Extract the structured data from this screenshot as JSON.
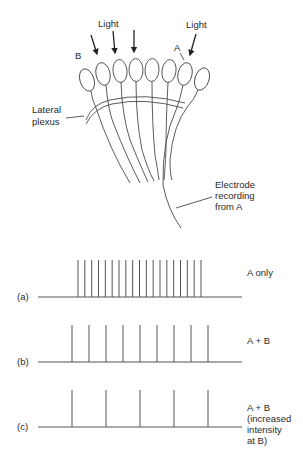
{
  "diagram": {
    "labels": {
      "light_left": "Light",
      "light_right": "Light",
      "cell_b": "B",
      "cell_a": "A",
      "lateral_plexus_1": "Lateral",
      "lateral_plexus_2": "plexus",
      "electrode_1": "Electrode",
      "electrode_2": "recording",
      "electrode_3": "from A"
    },
    "ommatidia_count": 8,
    "light_arrows": 4
  },
  "traces": [
    {
      "id": "a",
      "label": "(a)",
      "condition": [
        "A only"
      ],
      "spike_count": 19
    },
    {
      "id": "b",
      "label": "(b)",
      "condition": [
        "A + B"
      ],
      "spike_count": 9
    },
    {
      "id": "c",
      "label": "(c)",
      "condition": [
        "A + B",
        "(increased",
        "intensity",
        "at B)"
      ],
      "spike_count": 5
    }
  ]
}
